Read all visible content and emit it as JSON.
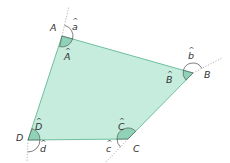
{
  "diagram": {
    "type": "quadrilateral-with-exterior-angles",
    "colors": {
      "fill": "#c6ecdd",
      "stroke": "#6fbfa0",
      "interior_arc_fill": "#8fd2b7",
      "extension_line": "#9a9a9a",
      "label": "#333333"
    },
    "vertices": [
      {
        "name": "A",
        "x": 62,
        "y": 36,
        "interior_label": "Â",
        "exterior_label": "â"
      },
      {
        "name": "B",
        "x": 193,
        "y": 73,
        "interior_label": "B̂",
        "exterior_label": "b̂"
      },
      {
        "name": "C",
        "x": 128,
        "y": 139,
        "interior_label": "Ĉ",
        "exterior_label": "ĉ"
      },
      {
        "name": "D",
        "x": 28,
        "y": 140,
        "interior_label": "D̂",
        "exterior_label": "d̂"
      }
    ],
    "labels": {
      "A": "A",
      "B": "B",
      "C": "C",
      "D": "D",
      "a": "a",
      "b": "b",
      "c": "c",
      "d": "d",
      "hat": "^"
    }
  }
}
